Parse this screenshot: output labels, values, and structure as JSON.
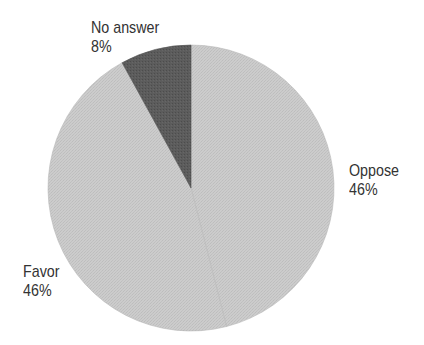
{
  "chart_data": {
    "type": "pie",
    "title": "",
    "start_angle_deg": 0,
    "direction": "clockwise",
    "slices": [
      {
        "label": "Oppose",
        "value": 46,
        "display": "46%",
        "color": "#c9c9c9"
      },
      {
        "label": "Favor",
        "value": 46,
        "display": "46%",
        "color": "#cbcbcb"
      },
      {
        "label": "No answer",
        "value": 8,
        "display": "8%",
        "color": "#5a5a5a"
      }
    ],
    "legend": "none",
    "labels_position": "outside"
  },
  "labels": {
    "no_answer": {
      "name": "No answer",
      "pct": "8%"
    },
    "oppose": {
      "name": "Oppose",
      "pct": "46%"
    },
    "favor": {
      "name": "Favor",
      "pct": "46%"
    }
  },
  "colors": {
    "light_slice": "#c9c9c9",
    "dark_slice": "#5a5a5a",
    "text": "#333333",
    "background": "#ffffff"
  }
}
